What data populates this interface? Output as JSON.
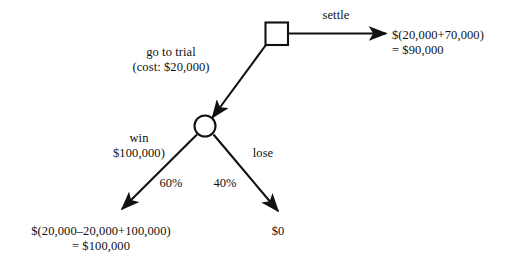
{
  "diagram": {
    "type": "decision-tree",
    "background_color": "#ffffff",
    "stroke_color": "#111111",
    "text_color": "#111111",
    "nodes": {
      "decision": {
        "shape": "square",
        "label": "",
        "x": 276,
        "y": 33
      },
      "chance": {
        "shape": "circle",
        "label": "",
        "x": 205,
        "y": 126
      }
    },
    "branches": {
      "settle": {
        "label": "settle",
        "payoff_line1": "$(20,000+70,000)",
        "payoff_line2": "= $90,000"
      },
      "go_to_trial": {
        "label_line1": "go to trial",
        "label_line2": "(cost: $20,000)"
      },
      "win": {
        "label_line1": "win",
        "label_line2": "$100,000)",
        "probability": "60%",
        "payoff_line1": "$(20,000–20,000+100,000)",
        "payoff_line2": "= $100,000"
      },
      "lose": {
        "label": "lose",
        "probability": "40%",
        "payoff": "$0"
      }
    }
  }
}
